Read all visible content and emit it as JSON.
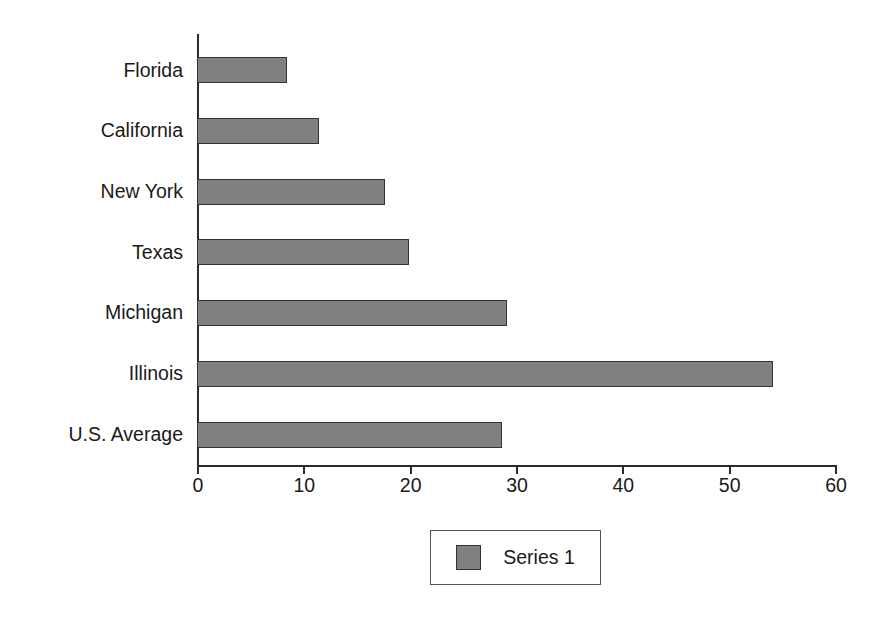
{
  "chart_data": {
    "type": "bar",
    "orientation": "horizontal",
    "title": "",
    "xlabel": "",
    "ylabel": "",
    "categories": [
      "Florida",
      "California",
      "New York",
      "Texas",
      "Michigan",
      "Illinois",
      "U.S. Average"
    ],
    "values": [
      8.5,
      11.5,
      17.7,
      19.9,
      29.2,
      54.2,
      28.7
    ],
    "series": [
      {
        "name": "Series 1",
        "values": [
          8.5,
          11.5,
          17.7,
          19.9,
          29.2,
          54.2,
          28.7
        ],
        "color": "#808080"
      }
    ],
    "xlim": [
      0,
      60
    ],
    "xticks": [
      0,
      10,
      20,
      30,
      40,
      50,
      60
    ],
    "xtick_labels": [
      "0",
      "10",
      "20",
      "30",
      "40",
      "50",
      "60"
    ],
    "grid": false,
    "legend": {
      "position": "bottom-center",
      "entries": [
        {
          "label": "Series 1",
          "color": "#808080"
        }
      ]
    },
    "colors": {
      "bar_fill": "#808080",
      "bar_border": "#333333",
      "axis": "#2b2b2b",
      "text": "#1a1a1a",
      "background": "#ffffff"
    }
  }
}
